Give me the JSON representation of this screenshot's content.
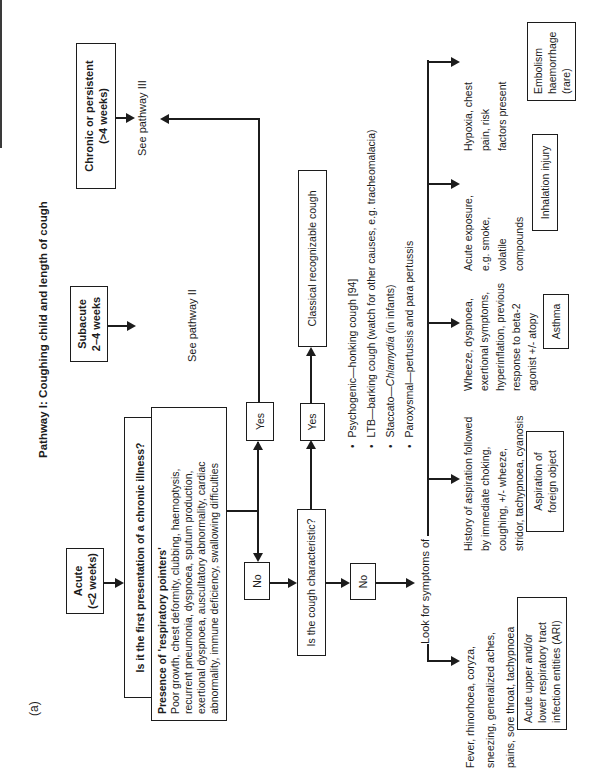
{
  "figure_label": "(a)",
  "title": "Pathway I: Coughing child and length of cough",
  "colors": {
    "ink": "#1c1c1c",
    "background": "#ffffff"
  },
  "top_row": {
    "acute": {
      "title": "Acute",
      "subtitle": "(<2 weeks)"
    },
    "subacute": {
      "title": "Subacute",
      "subtitle": "2–4 weeks"
    },
    "chronic": {
      "title": "Chronic or persistent",
      "subtitle": "(>4 weeks)"
    },
    "see_pathway_ii": "See pathway II",
    "see_pathway_iii": "See pathway III"
  },
  "decision1": {
    "question": "Is it the first presentation of a chronic illness?",
    "yes": "Yes",
    "no": "No"
  },
  "pointers": {
    "heading": "Presence of 'respiratory pointers'",
    "lines": [
      "Poor growth, chest deformity, clubbing, haemoptysis,",
      "recurrent pneumonia, dyspnoea, sputum production,",
      "exertional dyspnoea, auscultatory abnormality, cardiac",
      "abnormality, immune deficiency, swallowing difficulties"
    ]
  },
  "decision2": {
    "question": "Is the cough characteristic?",
    "yes": "Yes",
    "no": "No",
    "classical_box": "Classical recognizable cough",
    "bullets": {
      "b1": "Psychogenic—honking cough [94]",
      "b2": "LTB—barking cough (watch for other causes, e.g. tracheomalacia)",
      "b3_prefix": "Staccato—",
      "b3_italic": "Chlamydia",
      "b3_suffix": " (in infants)",
      "b4": "Paroxysmal—pertussis and para pertussis"
    }
  },
  "symptoms": {
    "lead": "Look for symptoms of",
    "branches": [
      {
        "lines": [
          "Fever, rhinorhoea, coryza,",
          "sneezing, generalized aches,",
          "pains, sore throat, tachypnoea"
        ],
        "box": [
          "Acute upper and/or",
          "lower respiratory tract",
          "infection entities (ARI)"
        ]
      },
      {
        "lines": [
          "History of aspiration followed",
          "by immediate choking,",
          "coughing, +/- wheeze,",
          "stridor, tachypnoea, cyanosis"
        ],
        "box": [
          "Aspiration of",
          "foreign object"
        ]
      },
      {
        "lines": [
          "Wheeze, dyspnoea,",
          "exertional symptoms,",
          "hyperinflation, previous",
          "response to beta-2",
          "agonist +/- atopy"
        ],
        "box": [
          "Asthma"
        ]
      },
      {
        "lines": [
          "Acute exposure,",
          "e.g. smoke,",
          "volatile",
          "compounds"
        ],
        "box": [
          "Inhalation injury"
        ]
      },
      {
        "lines": [
          "Hypoxia, chest",
          "pain, risk",
          "factors present"
        ],
        "box": [
          "Embolism",
          "haemorrhage",
          "(rare)"
        ]
      }
    ]
  }
}
